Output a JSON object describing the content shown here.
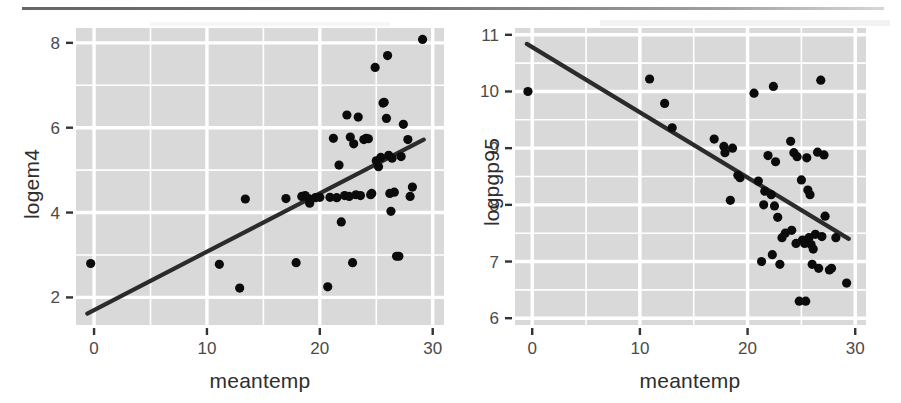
{
  "figure": {
    "background": "#ffffff",
    "panel_fill": "#d9d9d9",
    "grid_color": "#ffffff",
    "point_color": "#0b0b0b",
    "line_color": "#2b2b2b",
    "tick_color": "#4a4a4a",
    "label_color": "#2e2e2e"
  },
  "chart_data": [
    {
      "type": "scatter",
      "id": "panel-left",
      "title": "",
      "xlabel": "meantemp",
      "ylabel": "logem4",
      "xlim": [
        -1.6,
        31.0
      ],
      "ylim": [
        1.35,
        8.35
      ],
      "xticks": [
        0,
        10,
        20,
        30
      ],
      "xticklabels": [
        "0",
        "10",
        "20",
        "30"
      ],
      "yticks": [
        2,
        4,
        6,
        8
      ],
      "yticklabels": [
        "2",
        "4",
        "6",
        "8"
      ],
      "x_minor_ticks": [
        5,
        15,
        25
      ],
      "y_minor_ticks": [
        3,
        5,
        7
      ],
      "grid": true,
      "legend": "none",
      "fit_line": {
        "type": "linear",
        "x_start": -0.6,
        "y_start": 1.62,
        "x_end": 29.2,
        "y_end": 5.72,
        "slope": 0.1376,
        "intercept": 1.7026
      },
      "points": [
        [
          -0.3,
          2.8
        ],
        [
          11.1,
          2.78
        ],
        [
          12.9,
          2.22
        ],
        [
          13.4,
          4.32
        ],
        [
          17.0,
          4.33
        ],
        [
          17.9,
          2.82
        ],
        [
          18.4,
          4.38
        ],
        [
          18.7,
          4.4
        ],
        [
          19.0,
          4.33
        ],
        [
          19.1,
          4.22
        ],
        [
          19.6,
          4.35
        ],
        [
          20.0,
          4.36
        ],
        [
          20.7,
          2.25
        ],
        [
          20.9,
          4.36
        ],
        [
          21.2,
          5.75
        ],
        [
          21.5,
          4.35
        ],
        [
          21.7,
          5.12
        ],
        [
          21.9,
          3.78
        ],
        [
          22.2,
          4.4
        ],
        [
          22.4,
          6.3
        ],
        [
          22.6,
          4.38
        ],
        [
          22.7,
          5.78
        ],
        [
          22.9,
          2.82
        ],
        [
          23.0,
          5.62
        ],
        [
          23.2,
          4.42
        ],
        [
          23.4,
          6.25
        ],
        [
          23.6,
          4.4
        ],
        [
          23.9,
          5.72
        ],
        [
          24.1,
          5.75
        ],
        [
          24.3,
          5.74
        ],
        [
          24.5,
          4.42
        ],
        [
          24.6,
          4.45
        ],
        [
          24.9,
          7.42
        ],
        [
          25.0,
          5.22
        ],
        [
          25.2,
          5.08
        ],
        [
          25.4,
          5.3
        ],
        [
          25.6,
          6.58
        ],
        [
          25.7,
          6.6
        ],
        [
          25.9,
          6.22
        ],
        [
          26.0,
          7.7
        ],
        [
          26.1,
          5.35
        ],
        [
          26.2,
          4.45
        ],
        [
          26.3,
          4.03
        ],
        [
          26.4,
          5.28
        ],
        [
          26.6,
          4.48
        ],
        [
          26.8,
          2.97
        ],
        [
          27.0,
          2.97
        ],
        [
          27.2,
          5.32
        ],
        [
          27.4,
          6.08
        ],
        [
          27.8,
          5.72
        ],
        [
          28.0,
          4.38
        ],
        [
          28.2,
          4.6
        ],
        [
          29.1,
          8.08
        ]
      ]
    },
    {
      "type": "scatter",
      "id": "panel-right",
      "title": "",
      "xlabel": "meantemp",
      "ylabel": "logpgp95",
      "xlim": [
        -1.6,
        31.0
      ],
      "ylim": [
        5.88,
        11.12
      ],
      "xticks": [
        0,
        10,
        20,
        30
      ],
      "xticklabels": [
        "0",
        "10",
        "20",
        "30"
      ],
      "yticks": [
        6,
        7,
        8,
        9,
        10,
        11
      ],
      "yticklabels": [
        "6",
        "7",
        "8",
        "9",
        "10",
        "11"
      ],
      "x_minor_ticks": [
        5,
        15,
        25
      ],
      "y_minor_ticks": [
        6.5,
        7.5,
        8.5,
        9.5,
        10.5
      ],
      "grid": true,
      "legend": "none",
      "fit_line": {
        "type": "linear",
        "x_start": -0.5,
        "y_start": 10.84,
        "x_end": 29.4,
        "y_end": 7.4,
        "slope": -0.1151,
        "intercept": 10.782
      },
      "points": [
        [
          -0.4,
          10.0
        ],
        [
          10.9,
          10.22
        ],
        [
          12.3,
          9.79
        ],
        [
          13.0,
          9.36
        ],
        [
          16.9,
          9.16
        ],
        [
          17.8,
          9.03
        ],
        [
          17.9,
          8.92
        ],
        [
          18.4,
          8.08
        ],
        [
          18.6,
          9.0
        ],
        [
          19.1,
          8.52
        ],
        [
          19.3,
          8.48
        ],
        [
          20.6,
          9.97
        ],
        [
          21.0,
          8.42
        ],
        [
          21.3,
          7.0
        ],
        [
          21.5,
          8.0
        ],
        [
          21.6,
          8.24
        ],
        [
          21.9,
          8.87
        ],
        [
          22.2,
          8.18
        ],
        [
          22.3,
          7.12
        ],
        [
          22.4,
          10.09
        ],
        [
          22.5,
          7.98
        ],
        [
          22.6,
          8.76
        ],
        [
          22.8,
          7.78
        ],
        [
          23.0,
          6.95
        ],
        [
          23.2,
          7.42
        ],
        [
          23.5,
          7.5
        ],
        [
          24.0,
          9.12
        ],
        [
          24.1,
          7.55
        ],
        [
          24.3,
          8.92
        ],
        [
          24.5,
          7.32
        ],
        [
          24.6,
          8.85
        ],
        [
          24.8,
          6.3
        ],
        [
          25.0,
          8.44
        ],
        [
          25.1,
          7.38
        ],
        [
          25.3,
          7.32
        ],
        [
          25.4,
          6.3
        ],
        [
          25.5,
          8.83
        ],
        [
          25.6,
          8.26
        ],
        [
          25.7,
          7.42
        ],
        [
          25.8,
          8.18
        ],
        [
          25.9,
          7.3
        ],
        [
          26.0,
          6.95
        ],
        [
          26.1,
          7.22
        ],
        [
          26.3,
          7.48
        ],
        [
          26.5,
          8.93
        ],
        [
          26.6,
          6.88
        ],
        [
          26.8,
          10.2
        ],
        [
          26.9,
          7.44
        ],
        [
          27.1,
          8.88
        ],
        [
          27.2,
          7.8
        ],
        [
          27.6,
          6.85
        ],
        [
          27.8,
          6.88
        ],
        [
          28.2,
          7.42
        ],
        [
          29.2,
          6.62
        ]
      ]
    }
  ]
}
